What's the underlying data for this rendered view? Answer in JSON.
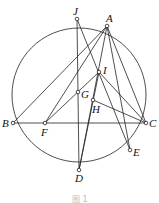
{
  "figure": {
    "caption": "图 1",
    "circle": {
      "cx": 79,
      "cy": 95,
      "r": 67
    },
    "points": {
      "J": {
        "label": "J",
        "x": 77,
        "y": 19
      },
      "A": {
        "label": "A",
        "x": 107,
        "y": 26
      },
      "I": {
        "label": "I",
        "x": 99,
        "y": 72
      },
      "G": {
        "label": "G",
        "x": 78,
        "y": 92
      },
      "H": {
        "label": "H",
        "x": 93,
        "y": 100
      },
      "B": {
        "label": "B",
        "x": 13,
        "y": 123
      },
      "F": {
        "label": "F",
        "x": 45,
        "y": 123
      },
      "C": {
        "label": "C",
        "x": 146,
        "y": 123
      },
      "E": {
        "label": "E",
        "x": 130,
        "y": 150
      },
      "D": {
        "label": "D",
        "x": 79,
        "y": 170
      }
    },
    "segments": [
      [
        "B",
        "C"
      ],
      [
        "A",
        "B"
      ],
      [
        "A",
        "F"
      ],
      [
        "A",
        "C"
      ],
      [
        "A",
        "E"
      ],
      [
        "A",
        "D"
      ],
      [
        "J",
        "D"
      ],
      [
        "J",
        "E"
      ],
      [
        "F",
        "I"
      ],
      [
        "I",
        "C"
      ],
      [
        "I",
        "D"
      ],
      [
        "H",
        "C"
      ]
    ]
  }
}
